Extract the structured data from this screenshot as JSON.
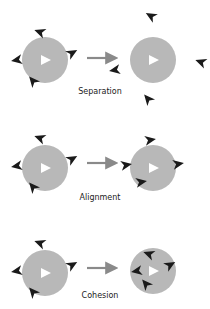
{
  "colors": {
    "circle": "#b8b8b8",
    "boid": "#1a1a1a",
    "focal_boid": "#ffffff",
    "arrow": "#8a8a8a"
  },
  "panels": [
    {
      "label": "Separation",
      "label_pos": [
        100,
        94
      ],
      "left": {
        "cx": 45,
        "cy": 60,
        "r": 23,
        "boids": [
          [
            40,
            32,
            200
          ],
          [
            17,
            60,
            170
          ],
          [
            72,
            53,
            -30
          ],
          [
            33,
            81,
            230
          ]
        ]
      },
      "right": {
        "cx": 153,
        "cy": 60,
        "r": 23,
        "boids": [
          [
            151,
            16,
            210
          ],
          [
            115,
            70,
            170
          ],
          [
            201,
            62,
            200
          ],
          [
            148,
            99,
            230
          ]
        ]
      },
      "arrow": {
        "x1": 87,
        "x2": 114,
        "y": 58
      }
    },
    {
      "label": "Alignment",
      "label_pos": [
        100,
        200
      ],
      "left": {
        "cx": 45,
        "cy": 168,
        "r": 23,
        "boids": [
          [
            40,
            138,
            200
          ],
          [
            17,
            166,
            170
          ],
          [
            72,
            159,
            -30
          ],
          [
            33,
            187,
            230
          ]
        ]
      },
      "right": {
        "cx": 153,
        "cy": 168,
        "r": 23,
        "boids": [
          [
            150,
            140,
            -10
          ],
          [
            126,
            165,
            -10
          ],
          [
            178,
            164,
            -10
          ],
          [
            141,
            182,
            -10
          ]
        ]
      },
      "arrow": {
        "x1": 87,
        "x2": 114,
        "y": 163
      }
    },
    {
      "label": "Cohesion",
      "label_pos": [
        100,
        298
      ],
      "left": {
        "cx": 45,
        "cy": 273,
        "r": 23,
        "boids": [
          [
            40,
            243,
            200
          ],
          [
            17,
            271,
            170
          ],
          [
            72,
            265,
            -30
          ],
          [
            33,
            292,
            230
          ]
        ]
      },
      "right": {
        "cx": 153,
        "cy": 271,
        "r": 23,
        "boids": [
          [
            149,
            254,
            200
          ],
          [
            137,
            271,
            170
          ],
          [
            170,
            265,
            -30
          ],
          [
            146,
            284,
            230
          ]
        ]
      },
      "arrow": {
        "x1": 87,
        "x2": 114,
        "y": 268
      }
    }
  ]
}
